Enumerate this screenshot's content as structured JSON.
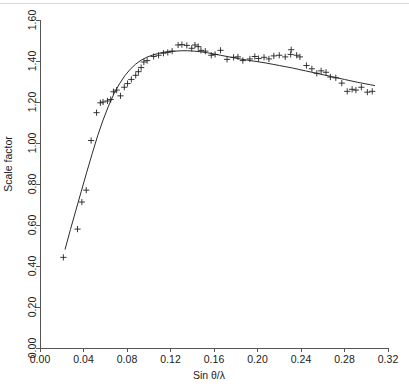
{
  "figure": {
    "background_color": "#ffffff",
    "width": 409,
    "height": 386
  },
  "chart_data": {
    "type": "scatter",
    "title": "",
    "subtitle": "",
    "xlabel": "Sin θ/λ",
    "ylabel": "Scale factor",
    "xlim": [
      0.0,
      0.32
    ],
    "ylim": [
      0.0,
      1.6
    ],
    "xticks": [
      0.0,
      0.04,
      0.08,
      0.12,
      0.16,
      0.2,
      0.24,
      0.28,
      0.32
    ],
    "yticks": [
      0.0,
      0.2,
      0.4,
      0.6,
      0.8,
      1.0,
      1.2,
      1.4,
      1.6
    ],
    "xtick_labels": [
      "0.00",
      "0.04",
      "0.08",
      "0.12",
      "0.16",
      "0.20",
      "0.24",
      "0.28",
      "0.32"
    ],
    "ytick_labels": [
      "0.00",
      "0.20",
      "0.40",
      "0.60",
      "0.80",
      "1.00",
      "1.20",
      "1.40",
      "1.60"
    ],
    "grid": false,
    "legend": null,
    "legend_position": "none",
    "annotations": [],
    "series": [
      {
        "name": "Observed scale factor",
        "type": "scatter",
        "marker": "plus",
        "color": "#222222",
        "points": [
          [
            0.0215,
            0.442
          ],
          [
            0.0345,
            0.58
          ],
          [
            0.0385,
            0.712
          ],
          [
            0.0425,
            0.77
          ],
          [
            0.047,
            1.012
          ],
          [
            0.052,
            1.148
          ],
          [
            0.0555,
            1.196
          ],
          [
            0.058,
            1.2
          ],
          [
            0.062,
            1.205
          ],
          [
            0.065,
            1.212
          ],
          [
            0.0675,
            1.25
          ],
          [
            0.0705,
            1.258
          ],
          [
            0.074,
            1.23
          ],
          [
            0.0775,
            1.272
          ],
          [
            0.0805,
            1.29
          ],
          [
            0.084,
            1.31
          ],
          [
            0.088,
            1.33
          ],
          [
            0.0905,
            1.348
          ],
          [
            0.093,
            1.368
          ],
          [
            0.0955,
            1.395
          ],
          [
            0.0985,
            1.402
          ],
          [
            0.1045,
            1.422
          ],
          [
            0.109,
            1.428
          ],
          [
            0.1135,
            1.438
          ],
          [
            0.1175,
            1.442
          ],
          [
            0.1215,
            1.448
          ],
          [
            0.127,
            1.478
          ],
          [
            0.1305,
            1.48
          ],
          [
            0.135,
            1.476
          ],
          [
            0.1395,
            1.462
          ],
          [
            0.1425,
            1.478
          ],
          [
            0.1455,
            1.47
          ],
          [
            0.148,
            1.452
          ],
          [
            0.152,
            1.448
          ],
          [
            0.1575,
            1.428
          ],
          [
            0.161,
            1.432
          ],
          [
            0.166,
            1.452
          ],
          [
            0.172,
            1.408
          ],
          [
            0.178,
            1.418
          ],
          [
            0.182,
            1.42
          ],
          [
            0.1865,
            1.402
          ],
          [
            0.193,
            1.41
          ],
          [
            0.1975,
            1.422
          ],
          [
            0.201,
            1.412
          ],
          [
            0.206,
            1.418
          ],
          [
            0.2105,
            1.41
          ],
          [
            0.215,
            1.425
          ],
          [
            0.22,
            1.428
          ],
          [
            0.2255,
            1.42
          ],
          [
            0.2305,
            1.432
          ],
          [
            0.231,
            1.455
          ],
          [
            0.236,
            1.428
          ],
          [
            0.239,
            1.42
          ],
          [
            0.245,
            1.378
          ],
          [
            0.25,
            1.362
          ],
          [
            0.2545,
            1.34
          ],
          [
            0.2585,
            1.352
          ],
          [
            0.263,
            1.345
          ],
          [
            0.267,
            1.322
          ],
          [
            0.272,
            1.318
          ],
          [
            0.2775,
            1.292
          ],
          [
            0.2825,
            1.252
          ],
          [
            0.287,
            1.262
          ],
          [
            0.2905,
            1.258
          ],
          [
            0.2955,
            1.272
          ],
          [
            0.301,
            1.248
          ],
          [
            0.3055,
            1.252
          ]
        ]
      },
      {
        "name": "Fitted curve",
        "type": "line",
        "color": "#2b2b2b",
        "points": [
          [
            0.023,
            0.48
          ],
          [
            0.028,
            0.578
          ],
          [
            0.033,
            0.672
          ],
          [
            0.038,
            0.765
          ],
          [
            0.043,
            0.858
          ],
          [
            0.048,
            0.948
          ],
          [
            0.053,
            1.035
          ],
          [
            0.058,
            1.112
          ],
          [
            0.063,
            1.18
          ],
          [
            0.068,
            1.24
          ],
          [
            0.073,
            1.288
          ],
          [
            0.078,
            1.328
          ],
          [
            0.083,
            1.36
          ],
          [
            0.088,
            1.385
          ],
          [
            0.093,
            1.404
          ],
          [
            0.098,
            1.418
          ],
          [
            0.103,
            1.428
          ],
          [
            0.108,
            1.436
          ],
          [
            0.113,
            1.442
          ],
          [
            0.118,
            1.446
          ],
          [
            0.124,
            1.448
          ],
          [
            0.13,
            1.45
          ],
          [
            0.136,
            1.45
          ],
          [
            0.142,
            1.448
          ],
          [
            0.148,
            1.445
          ],
          [
            0.154,
            1.44
          ],
          [
            0.16,
            1.434
          ],
          [
            0.166,
            1.428
          ],
          [
            0.172,
            1.422
          ],
          [
            0.178,
            1.416
          ],
          [
            0.184,
            1.41
          ],
          [
            0.19,
            1.405
          ],
          [
            0.196,
            1.4
          ],
          [
            0.202,
            1.395
          ],
          [
            0.208,
            1.39
          ],
          [
            0.214,
            1.384
          ],
          [
            0.22,
            1.378
          ],
          [
            0.226,
            1.372
          ],
          [
            0.232,
            1.366
          ],
          [
            0.238,
            1.359
          ],
          [
            0.244,
            1.352
          ],
          [
            0.25,
            1.345
          ],
          [
            0.256,
            1.338
          ],
          [
            0.262,
            1.331
          ],
          [
            0.268,
            1.324
          ],
          [
            0.274,
            1.317
          ],
          [
            0.28,
            1.31
          ],
          [
            0.286,
            1.303
          ],
          [
            0.292,
            1.296
          ],
          [
            0.298,
            1.29
          ],
          [
            0.304,
            1.284
          ],
          [
            0.308,
            1.28
          ]
        ]
      }
    ]
  },
  "geometry": {
    "plot_left": 40,
    "plot_right": 388,
    "plot_top": 20,
    "plot_bottom": 348
  }
}
